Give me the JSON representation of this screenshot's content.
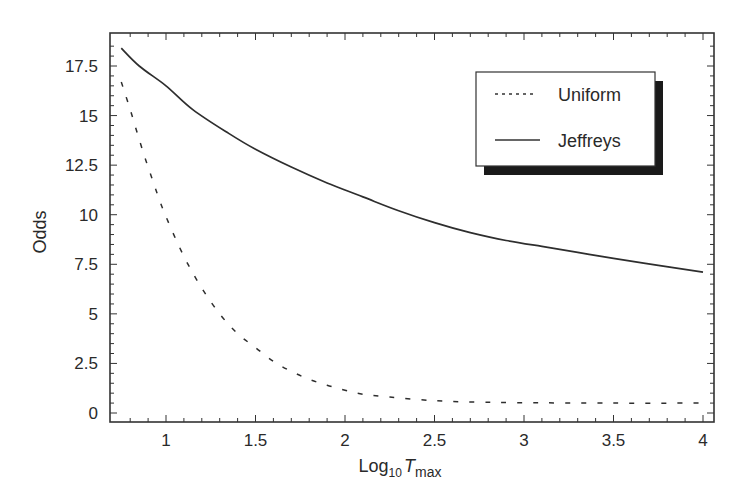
{
  "chart_data": {
    "type": "line",
    "title": "",
    "xlabel": "Log10 Tmax",
    "xlabel_parts": {
      "base": "Log",
      "sub1": "10",
      "var": "T",
      "sub2": "max"
    },
    "ylabel": "Odds",
    "xlim": [
      0.75,
      4.05
    ],
    "ylim": [
      -0.5,
      19.0
    ],
    "x_ticks": [
      1,
      1.5,
      2,
      2.5,
      3,
      3.5,
      4
    ],
    "x_tick_labels": [
      "1",
      "1.5",
      "2",
      "2.5",
      "3",
      "3.5",
      "4"
    ],
    "y_ticks": [
      0,
      2.5,
      5,
      7.5,
      10,
      12.5,
      15,
      17.5
    ],
    "y_tick_labels": [
      "0",
      "2.5",
      "5",
      "7.5",
      "10",
      "12.5",
      "15",
      "17.5"
    ],
    "grid": false,
    "legend_position": "upper right",
    "series": [
      {
        "name": "Uniform",
        "style": "dashed",
        "x": [
          0.75,
          0.8,
          0.85,
          0.9,
          0.95,
          1.0,
          1.1,
          1.2,
          1.3,
          1.4,
          1.5,
          1.6,
          1.7,
          1.8,
          1.9,
          2.0,
          2.1,
          2.25,
          2.5,
          2.75,
          3.0,
          3.5,
          4.0
        ],
        "values": [
          16.7,
          15.3,
          13.8,
          12.4,
          11.1,
          9.9,
          7.9,
          6.3,
          5.0,
          4.0,
          3.3,
          2.6,
          2.1,
          1.7,
          1.4,
          1.15,
          0.95,
          0.8,
          0.62,
          0.55,
          0.52,
          0.5,
          0.5
        ]
      },
      {
        "name": "Jeffreys",
        "style": "solid",
        "x": [
          0.75,
          0.85,
          1.0,
          1.15,
          1.35,
          1.5,
          1.7,
          1.9,
          2.1,
          2.3,
          2.5,
          2.7,
          2.9,
          3.1,
          3.3,
          3.5,
          3.75,
          4.0
        ],
        "values": [
          18.4,
          17.5,
          16.5,
          15.3,
          14.1,
          13.3,
          12.4,
          11.6,
          10.9,
          10.2,
          9.6,
          9.1,
          8.7,
          8.4,
          8.1,
          7.8,
          7.45,
          7.1
        ]
      }
    ]
  }
}
